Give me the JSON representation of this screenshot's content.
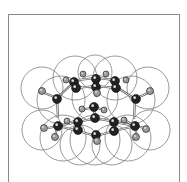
{
  "diagram": {
    "type": "molecular-space-filling-ball-and-stick",
    "colors": {
      "frame": "#8a8a8a",
      "vdw_outline": "#6e6e6e",
      "bond": "#555555",
      "heavy_atom": "#222222",
      "light_atom": "#9a9a9a",
      "background": "#ffffff"
    },
    "vdw_spheres": [
      {
        "cx": 42,
        "cy": 88,
        "r": 21
      },
      {
        "cx": 61,
        "cy": 100,
        "r": 24
      },
      {
        "cx": 95,
        "cy": 98,
        "r": 23
      },
      {
        "cx": 131,
        "cy": 100,
        "r": 24
      },
      {
        "cx": 148,
        "cy": 88,
        "r": 21
      },
      {
        "cx": 75,
        "cy": 78,
        "r": 22
      },
      {
        "cx": 115,
        "cy": 78,
        "r": 22
      },
      {
        "cx": 95,
        "cy": 72,
        "r": 17
      },
      {
        "cx": 42,
        "cy": 130,
        "r": 20
      },
      {
        "cx": 63,
        "cy": 138,
        "r": 23
      },
      {
        "cx": 95,
        "cy": 140,
        "r": 25
      },
      {
        "cx": 128,
        "cy": 138,
        "r": 23
      },
      {
        "cx": 150,
        "cy": 130,
        "r": 20
      },
      {
        "cx": 80,
        "cy": 145,
        "r": 20
      },
      {
        "cx": 112,
        "cy": 145,
        "r": 20
      }
    ],
    "bonds": [
      [
        42,
        92,
        57,
        98
      ],
      [
        57,
        98,
        74,
        82
      ],
      [
        57,
        98,
        58,
        118
      ],
      [
        42,
        92,
        40,
        90
      ],
      [
        74,
        82,
        78,
        80
      ],
      [
        78,
        80,
        96,
        78
      ],
      [
        96,
        78,
        115,
        80
      ],
      [
        115,
        80,
        118,
        88
      ],
      [
        118,
        88,
        135,
        99
      ],
      [
        135,
        99,
        150,
        92
      ],
      [
        135,
        99,
        134,
        119
      ],
      [
        74,
        82,
        76,
        88
      ],
      [
        76,
        88,
        96,
        86
      ],
      [
        96,
        86,
        116,
        88
      ],
      [
        96,
        86,
        97,
        92
      ],
      [
        97,
        92,
        96,
        97
      ],
      [
        82,
        110,
        94,
        107
      ],
      [
        94,
        107,
        104,
        110
      ],
      [
        94,
        107,
        95,
        119
      ],
      [
        58,
        126,
        78,
        122
      ],
      [
        78,
        122,
        96,
        118
      ],
      [
        96,
        118,
        114,
        122
      ],
      [
        114,
        122,
        135,
        126
      ],
      [
        58,
        126,
        78,
        131
      ],
      [
        78,
        131,
        96,
        136
      ],
      [
        96,
        136,
        114,
        131
      ],
      [
        114,
        131,
        135,
        126
      ],
      [
        58,
        126,
        48,
        128
      ],
      [
        58,
        126,
        54,
        138
      ],
      [
        135,
        126,
        145,
        128
      ],
      [
        135,
        126,
        137,
        138
      ],
      [
        124,
        120,
        135,
        126
      ]
    ],
    "atoms": [
      {
        "x": 42,
        "y": 91,
        "r": 3.5,
        "kind": "light"
      },
      {
        "x": 57,
        "y": 99,
        "r": 4.5,
        "kind": "heavy"
      },
      {
        "x": 66,
        "y": 80,
        "r": 3,
        "kind": "light"
      },
      {
        "x": 74,
        "y": 82,
        "r": 4.5,
        "kind": "heavy"
      },
      {
        "x": 76,
        "y": 88,
        "r": 4.5,
        "kind": "heavy"
      },
      {
        "x": 83,
        "y": 74,
        "r": 3,
        "kind": "light"
      },
      {
        "x": 96,
        "y": 79,
        "r": 4.5,
        "kind": "heavy"
      },
      {
        "x": 96,
        "y": 87,
        "r": 4.5,
        "kind": "heavy"
      },
      {
        "x": 97,
        "y": 93,
        "r": 3.5,
        "kind": "light"
      },
      {
        "x": 106,
        "y": 74,
        "r": 3,
        "kind": "light"
      },
      {
        "x": 115,
        "y": 81,
        "r": 4.5,
        "kind": "heavy"
      },
      {
        "x": 116,
        "y": 88,
        "r": 4.5,
        "kind": "heavy"
      },
      {
        "x": 126,
        "y": 80,
        "r": 3,
        "kind": "light"
      },
      {
        "x": 136,
        "y": 99,
        "r": 4.5,
        "kind": "heavy"
      },
      {
        "x": 150,
        "y": 91,
        "r": 3.5,
        "kind": "light"
      },
      {
        "x": 82,
        "y": 109,
        "r": 3,
        "kind": "light"
      },
      {
        "x": 94,
        "y": 107,
        "r": 4.5,
        "kind": "heavy"
      },
      {
        "x": 104,
        "y": 110,
        "r": 3,
        "kind": "light"
      },
      {
        "x": 95,
        "y": 118,
        "r": 4.5,
        "kind": "heavy"
      },
      {
        "x": 58,
        "y": 126,
        "r": 4.5,
        "kind": "heavy"
      },
      {
        "x": 44,
        "y": 128,
        "r": 3.5,
        "kind": "light"
      },
      {
        "x": 55,
        "y": 137,
        "r": 3.5,
        "kind": "light"
      },
      {
        "x": 67,
        "y": 121,
        "r": 3,
        "kind": "light"
      },
      {
        "x": 78,
        "y": 122,
        "r": 4.5,
        "kind": "heavy"
      },
      {
        "x": 78,
        "y": 130,
        "r": 4.5,
        "kind": "heavy"
      },
      {
        "x": 96,
        "y": 135,
        "r": 4.5,
        "kind": "heavy"
      },
      {
        "x": 97,
        "y": 141,
        "r": 3.5,
        "kind": "light"
      },
      {
        "x": 114,
        "y": 122,
        "r": 4.5,
        "kind": "heavy"
      },
      {
        "x": 114,
        "y": 131,
        "r": 4.5,
        "kind": "heavy"
      },
      {
        "x": 124,
        "y": 120,
        "r": 3,
        "kind": "light"
      },
      {
        "x": 135,
        "y": 126,
        "r": 4.5,
        "kind": "heavy"
      },
      {
        "x": 146,
        "y": 129,
        "r": 3.5,
        "kind": "light"
      },
      {
        "x": 136,
        "y": 137,
        "r": 3.5,
        "kind": "light"
      }
    ]
  }
}
